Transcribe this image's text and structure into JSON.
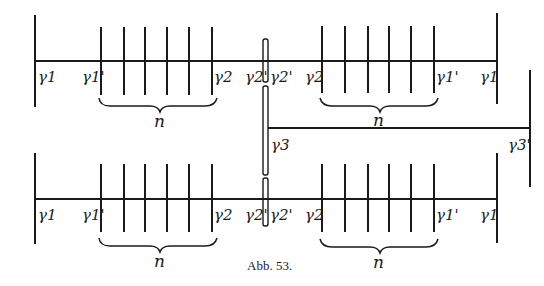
{
  "figure": {
    "caption": "Abb. 53.",
    "stroke_color": "#1a1a1a",
    "background": "#ffffff"
  },
  "top_chain": {
    "labels": [
      "γ1",
      "γ1'",
      "γ2",
      "γ2'",
      "γ2'",
      "γ2",
      "γ1'",
      "γ1"
    ],
    "left_group_label": "n",
    "right_group_label": "n"
  },
  "branch": {
    "labels": [
      "γ3",
      "γ3'"
    ]
  },
  "bottom_chain": {
    "labels": [
      "γ1",
      "γ1'",
      "γ2",
      "γ2'",
      "γ2'",
      "γ2",
      "γ1'",
      "γ1"
    ],
    "left_group_label": "n",
    "right_group_label": "n"
  }
}
